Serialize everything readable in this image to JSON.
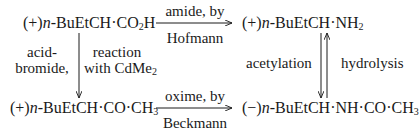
{
  "nodes": {
    "acid": {
      "sign": "(+)",
      "prefix": "n",
      "body": "-BuEtCH·CO",
      "sub": "2",
      "tail": "H"
    },
    "amine": {
      "sign": "(+)",
      "prefix": "n",
      "body": "-BuEtCH·NH",
      "sub": "2",
      "tail": ""
    },
    "ketone": {
      "sign": "(+)",
      "prefix": "n",
      "body": "-BuEtCH·CO·CH",
      "sub": "3",
      "tail": ""
    },
    "amide": {
      "sign": "(−)",
      "prefix": "n",
      "body": "-BuEtCH·NH·CO·CH",
      "sub": "3",
      "tail": ""
    }
  },
  "arrows": {
    "top": {
      "above": "amide, by",
      "below": "Hofmann"
    },
    "bottom": {
      "above": "oxime, by",
      "below": "Beckmann"
    },
    "left": {
      "left_line1": "acid-",
      "left_line2": "bromide,",
      "right_line1": "reaction",
      "right_line2": "with CdMe",
      "right_sub": "2"
    },
    "right": {
      "left": "acetylation",
      "right": "hydrolysis"
    }
  },
  "colors": {
    "ink": "#1a1a1a",
    "background": "#ffffff"
  }
}
